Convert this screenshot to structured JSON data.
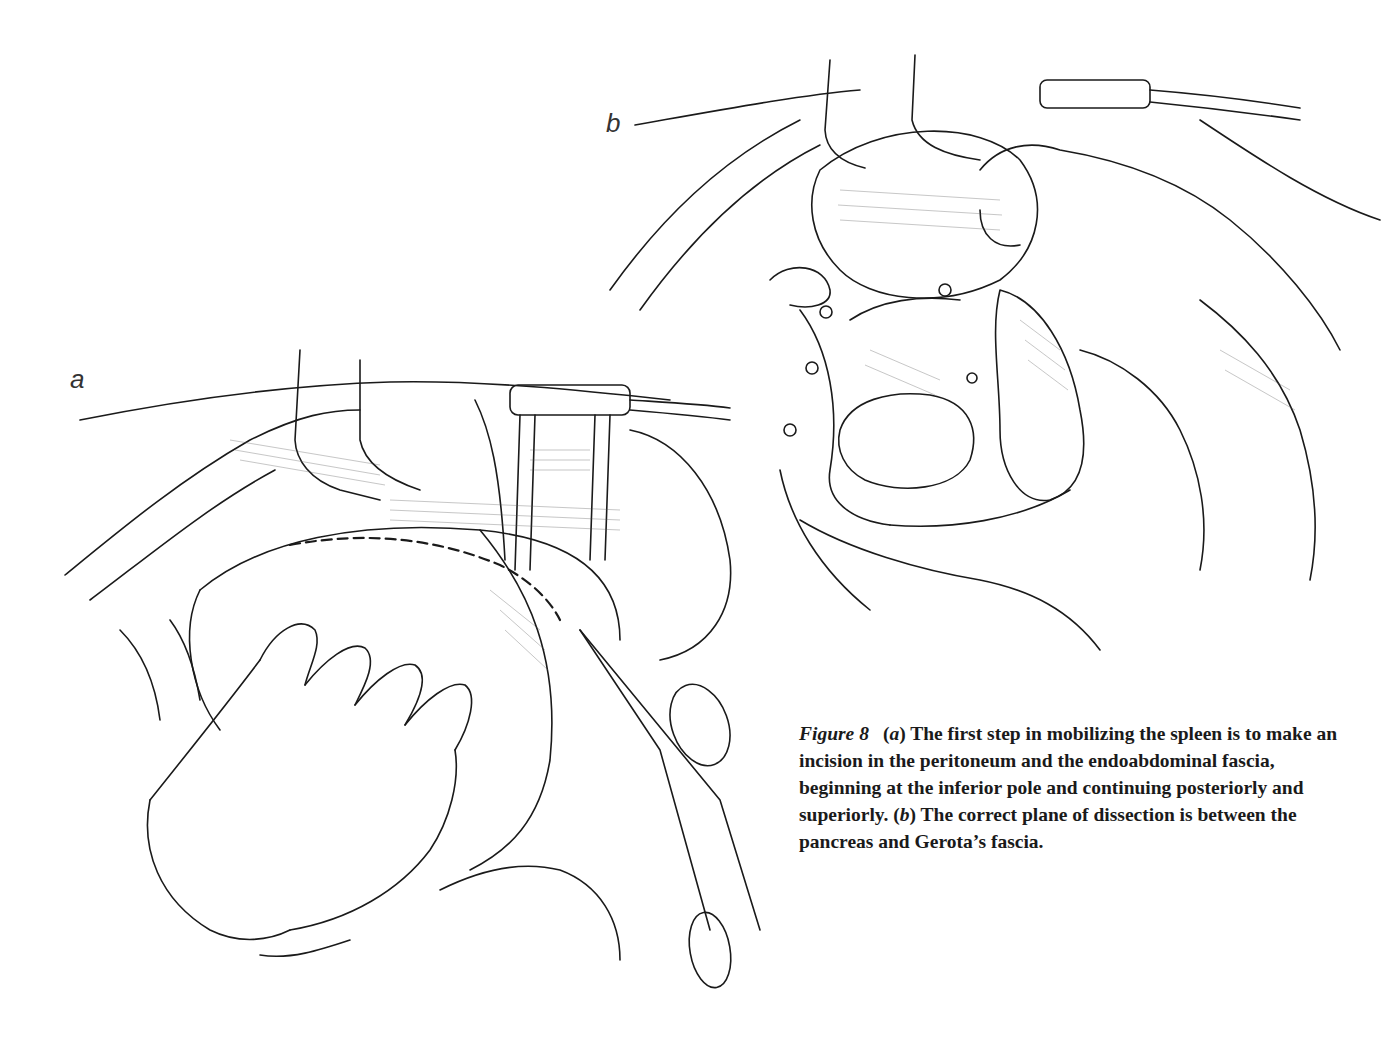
{
  "figure": {
    "number_label": "Figure 8",
    "panels": [
      {
        "id": "a",
        "label": "a",
        "description": "Incision in the peritoneum and endoabdominal fascia along the spleen; hand retracting spleen, retractor above, scissors at inferior pole"
      },
      {
        "id": "b",
        "label": "b",
        "description": "Spleen mobilized medially by hand, exposing plane of dissection between pancreas and Gerota's fascia"
      }
    ],
    "caption": {
      "part_a_marker": "(a)",
      "part_a_text": " The first step in mobilizing the spleen is to make an incision in the peritoneum and the endoabdominal fascia, beginning at the inferior pole and continuing posteriorly and superiorly. ",
      "part_b_marker": "(b)",
      "part_b_text": " The correct plane of dissection is between the pancreas and Gerota’s fascia."
    }
  },
  "colors": {
    "ink": "#1a1a1a",
    "background": "#ffffff"
  }
}
